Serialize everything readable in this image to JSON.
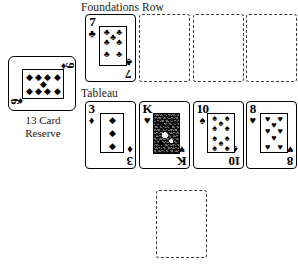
{
  "labels": {
    "foundations": "Foundations Row",
    "tableau": "Tableau",
    "reserve_caption_line1": "13 Card",
    "reserve_caption_line2": "Reserve"
  },
  "suits": {
    "diamond": "♦",
    "club": "♣",
    "spade": "♠",
    "heart": "♥"
  },
  "reserve": {
    "count_label": "13 Card Reserve",
    "card": {
      "rank": "9",
      "suit": "♦",
      "suit_name": "diamonds",
      "pips": 9,
      "orientation": "landscape"
    }
  },
  "foundations": {
    "cards": [
      {
        "rank": "7",
        "suit": "♣",
        "suit_name": "clubs",
        "pips": 7,
        "empty": false
      }
    ],
    "empty_slots": 3
  },
  "tableau": {
    "cards": [
      {
        "rank": "3",
        "suit": "♦",
        "suit_name": "diamonds",
        "pips": 3,
        "empty": false,
        "face": false
      },
      {
        "rank": "K",
        "suit": "♥",
        "suit_name": "hearts",
        "pips": 0,
        "empty": false,
        "face": true
      },
      {
        "rank": "10",
        "suit": "♠",
        "suit_name": "spades",
        "pips": 10,
        "empty": false,
        "face": false
      },
      {
        "rank": "8",
        "suit": "♥",
        "suit_name": "hearts",
        "pips": 8,
        "empty": false,
        "face": false
      }
    ],
    "empty_slots": 1
  },
  "colors": {
    "card_border": "#000000",
    "slot_border": "#3a3a3a",
    "background": "#ffffff",
    "text": "#1a1a1a"
  }
}
